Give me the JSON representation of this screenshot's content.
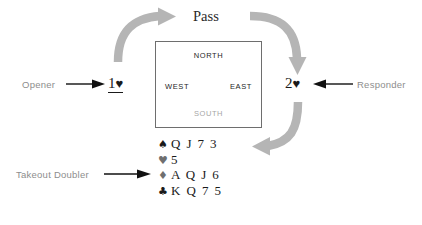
{
  "diagram": {
    "title_text": "Bridge bidding rotation with takeout doubler hand",
    "accent_gray": "#b0b0b0",
    "text_gray": "#8d8d8d",
    "text_dark": "#1a1a1a"
  },
  "auction": {
    "pass_label": "Pass",
    "opener": {
      "role_label": "Opener",
      "bid_number": "1",
      "bid_suit": "♥",
      "underlined": true
    },
    "responder": {
      "role_label": "Responder",
      "bid_number": "2",
      "bid_suit": "♥",
      "underlined": false
    },
    "takeout_doubler": {
      "role_label": "Takeout Doubler"
    }
  },
  "compass": {
    "north": "NORTH",
    "west": "WEST",
    "east": "EAST",
    "south": "SOUTH"
  },
  "hand": {
    "rows": [
      {
        "suit_symbol": "♠",
        "suit_name": "spades",
        "suit_color": "black",
        "cards": "Q J 7 3"
      },
      {
        "suit_symbol": "♥",
        "suit_name": "hearts",
        "suit_color": "gray",
        "cards": "5"
      },
      {
        "suit_symbol": "♦",
        "suit_name": "diamonds",
        "suit_color": "gray",
        "cards": "A Q J 6"
      },
      {
        "suit_symbol": "♣",
        "suit_name": "clubs",
        "suit_color": "black",
        "cards": "K Q 7 5"
      }
    ]
  },
  "icons": {
    "arrow_opener": "arrow-right-icon",
    "arrow_responder": "arrow-left-icon",
    "arrow_doubler": "arrow-right-icon",
    "rotation_top_left": "curved-arrow-up-right-icon",
    "rotation_top_right": "curved-arrow-down-icon",
    "rotation_bottom_right": "curved-arrow-down-left-icon"
  }
}
